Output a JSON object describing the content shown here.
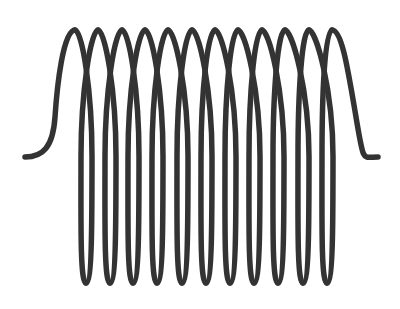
{
  "figure": {
    "description": "Helical coil spring illustration with 12 turns",
    "turns": 12,
    "stroke_color": "#333333",
    "background_color": "#ffffff",
    "stroke_width": 5.5,
    "left_tail": {
      "x": 25,
      "y": 157
    },
    "right_tail": {
      "x": 378,
      "y": 157
    },
    "top_peaks_x": [
      75,
      98,
      122,
      145,
      168,
      192,
      215,
      238,
      262,
      285,
      309,
      332
    ],
    "bottom_troughs_x": [
      86,
      110,
      133,
      157,
      182,
      206,
      230,
      254,
      278,
      303,
      327
    ],
    "top_y": 30,
    "bottom_y": 283
  }
}
